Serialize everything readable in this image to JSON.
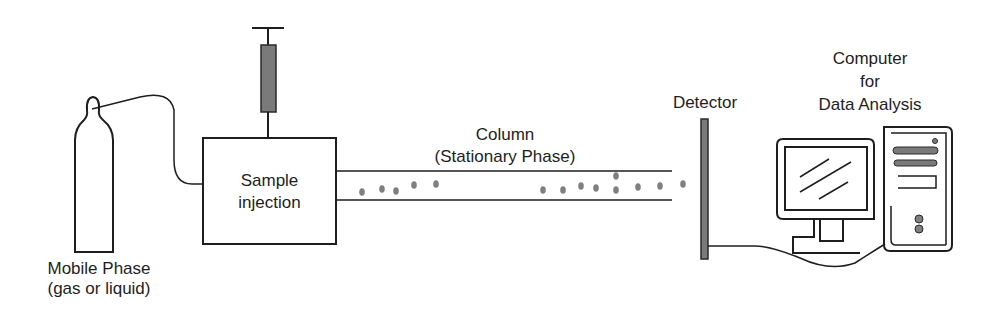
{
  "diagram": {
    "labels": {
      "mobile_phase_line1": "Mobile Phase",
      "mobile_phase_line2": "(gas or liquid)",
      "sample_injection_line1": "Sample",
      "sample_injection_line2": "injection",
      "column_line1": "Column",
      "column_line2": "(Stationary Phase)",
      "detector": "Detector",
      "computer_line1": "Computer",
      "computer_line2": "for",
      "computer_line3": "Data Analysis"
    },
    "components": [
      {
        "id": "gas-cylinder",
        "name": "Mobile Phase (gas or liquid)"
      },
      {
        "id": "syringe",
        "name": "Syringe"
      },
      {
        "id": "sample-injection-box",
        "name": "Sample injection"
      },
      {
        "id": "column",
        "name": "Column (Stationary Phase)"
      },
      {
        "id": "detector",
        "name": "Detector"
      },
      {
        "id": "computer",
        "name": "Computer for Data Analysis"
      }
    ],
    "connections": [
      {
        "from": "gas-cylinder",
        "to": "sample-injection-box"
      },
      {
        "from": "syringe",
        "to": "sample-injection-box"
      },
      {
        "from": "sample-injection-box",
        "to": "column"
      },
      {
        "from": "column",
        "to": "detector"
      },
      {
        "from": "detector",
        "to": "computer"
      }
    ],
    "colors": {
      "stroke": "#1e1e1e",
      "fill_gray": "#7a7a7a",
      "particle": "#808080",
      "background": "#ffffff"
    },
    "particles": [
      [
        362,
        192
      ],
      [
        382,
        189
      ],
      [
        396,
        191
      ],
      [
        414,
        185
      ],
      [
        436,
        184
      ],
      [
        543,
        190
      ],
      [
        563,
        190
      ],
      [
        581,
        186
      ],
      [
        596,
        188
      ],
      [
        616,
        176
      ],
      [
        616,
        190
      ],
      [
        638,
        187
      ],
      [
        660,
        186
      ],
      [
        683,
        184
      ]
    ]
  }
}
